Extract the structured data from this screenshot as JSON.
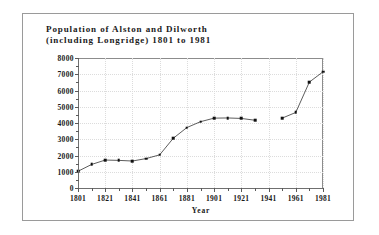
{
  "figure": {
    "title": "Population of Alston and Dilworth\n(including Longridge) 1801 to 1981",
    "border_color": "#9a9a9a",
    "background": "#ffffff"
  },
  "chart_data": {
    "type": "line",
    "title": "Population of Alston and Dilworth (including Longridge) 1801 to 1981",
    "xlabel": "Year",
    "ylabel": "",
    "xlim": [
      1801,
      1981
    ],
    "ylim": [
      0,
      8000
    ],
    "grid": true,
    "legend": false,
    "marker": "square",
    "line_color": "#333333",
    "marker_color": "#111111",
    "grid_color": "#dcdcdc",
    "x": [
      1801,
      1811,
      1821,
      1831,
      1841,
      1851,
      1861,
      1871,
      1881,
      1891,
      1901,
      1911,
      1921,
      1931,
      1951,
      1961,
      1971,
      1981
    ],
    "values": [
      1030,
      1450,
      1720,
      1700,
      1660,
      1810,
      2040,
      3060,
      3720,
      4080,
      4300,
      4310,
      4280,
      4170,
      4300,
      4650,
      6520,
      7150
    ],
    "series": [
      {
        "name": "Population",
        "x": [
          1801,
          1811,
          1821,
          1831,
          1841,
          1851,
          1861,
          1871,
          1881,
          1891,
          1901,
          1911,
          1921,
          1931,
          1951,
          1961,
          1971,
          1981
        ],
        "values": [
          1030,
          1450,
          1720,
          1700,
          1660,
          1810,
          2040,
          3060,
          3720,
          4080,
          4300,
          4310,
          4280,
          4170,
          4300,
          4650,
          6520,
          7150
        ],
        "gap_after": 1931
      }
    ],
    "yticks": [
      0,
      1000,
      2000,
      3000,
      4000,
      5000,
      6000,
      7000,
      8000
    ],
    "ytick_labels": [
      "0",
      "1000",
      "2000",
      "3000",
      "4000",
      "5000",
      "6000",
      "7000",
      "8000"
    ],
    "xticks_major": [
      1801,
      1821,
      1841,
      1861,
      1881,
      1901,
      1921,
      1941,
      1961,
      1981
    ],
    "xtick_labels": [
      "1801",
      "1821",
      "1841",
      "1861",
      "1881",
      "1901",
      "1921",
      "1941",
      "1961",
      "1981"
    ],
    "xticks_minor": [
      1811,
      1831,
      1851,
      1871,
      1891,
      1911,
      1931,
      1951,
      1971
    ]
  }
}
